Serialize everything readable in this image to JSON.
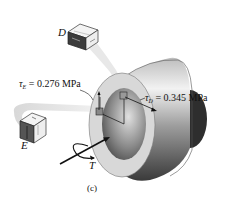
{
  "figure": {
    "caption": "(c)",
    "labels": {
      "point_D": "D",
      "point_E": "E",
      "torque": "T"
    },
    "stresses": {
      "tau_E": {
        "symbol": "τ",
        "subscript": "E",
        "value_text": " = 0.276 MPa"
      },
      "tau_D": {
        "symbol": "τ",
        "subscript": "D",
        "value_text": " = 0.345 MPa"
      }
    },
    "colors": {
      "shaft_light": "#e6e6e6",
      "shaft_mid": "#9a9a9a",
      "shaft_dark": "#3a3a3a",
      "ring_face": "#d9d9d9",
      "callout_band": "#e8e8e8",
      "arrow": "#111111"
    }
  }
}
